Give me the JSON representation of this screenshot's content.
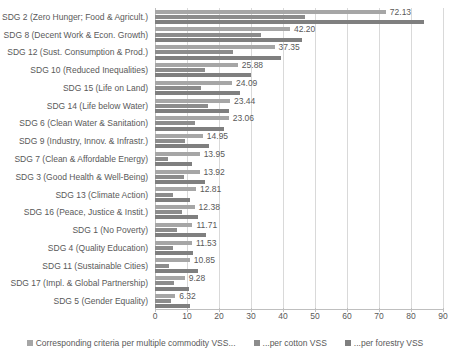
{
  "chart_data": {
    "type": "bar",
    "orientation": "horizontal",
    "title": "",
    "xlabel": "",
    "ylabel": "",
    "xlim": [
      0,
      90
    ],
    "xticks": [
      0,
      10,
      20,
      30,
      40,
      50,
      60,
      70,
      80,
      90
    ],
    "grid": true,
    "legend_position": "bottom",
    "categories": [
      "SDG 2 (Zero Hunger; Food & Agricult.)",
      "SDG 8 (Decent Work & Econ. Growth)",
      "SDG 12 (Sust. Consumption & Prod.)",
      "SDG 10 (Reduced Inequalities)",
      "SDG 15 (Life on Land)",
      "SDG 14 (Life below Water)",
      "SDG 6 (Clean Water & Sanitation)",
      "SDG 9 (Industry, Innov. & Infrastr.)",
      "SDG 7 (Clean & Affordable Energy)",
      "SDG 3 (Good Health & Well-Being)",
      "SDG 13 (Climate Action)",
      "SDG 16 (Peace, Justice & Instit.)",
      "SDG 1 (No Poverty)",
      "SDG 4 (Quality Education)",
      "SDG 11 (Sustainable Cities)",
      "SDG 17 (Impl. & Global Partnership)",
      "SDG 5 (Gender Equality)"
    ],
    "series": [
      {
        "name": "Corresponding criteria per multiple commodity VSS...",
        "color": "#a6a6a6",
        "labelled": true,
        "values": [
          72.13,
          42.2,
          37.35,
          25.88,
          24.09,
          23.44,
          23.06,
          14.95,
          13.95,
          13.92,
          12.81,
          12.38,
          11.71,
          11.53,
          10.85,
          9.28,
          6.32
        ],
        "data_labels": [
          "72.13",
          "42.20",
          "37.35",
          "25.88",
          "24.09",
          "23.44",
          "23.06",
          "14.95",
          "13.95",
          "13.92",
          "12.81",
          "12.38",
          "11.71",
          "11.53",
          "10.85",
          "9.28",
          "6.32"
        ]
      },
      {
        "name": "...per cotton VSS",
        "color": "#8c8c8c",
        "labelled": false,
        "values": [
          47.0,
          33.0,
          24.5,
          15.5,
          14.5,
          16.5,
          12.5,
          9.5,
          4.0,
          9.0,
          5.5,
          8.5,
          7.0,
          5.5,
          4.5,
          6.0,
          5.0
        ]
      },
      {
        "name": "...per forestry VSS",
        "color": "#7f7f7f",
        "labelled": false,
        "values": [
          84.0,
          46.0,
          39.5,
          30.0,
          26.5,
          23.0,
          21.5,
          17.0,
          11.5,
          15.5,
          11.0,
          13.5,
          16.0,
          12.0,
          13.5,
          10.5,
          11.0
        ]
      }
    ]
  }
}
